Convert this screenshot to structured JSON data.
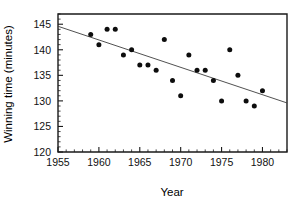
{
  "chart_data": {
    "type": "scatter",
    "title": "",
    "xlabel": "Year",
    "ylabel": "Winning time (minutes)",
    "xlim": [
      1955,
      1983
    ],
    "ylim": [
      120,
      147
    ],
    "grid": false,
    "legend": null,
    "x_ticks_major": [
      1955,
      1960,
      1965,
      1970,
      1975,
      1980
    ],
    "x_tick_labels": [
      "1955",
      "1960",
      "1965",
      "1970",
      "1975",
      "1980"
    ],
    "x_minor_step": 1,
    "y_ticks_major": [
      120,
      125,
      130,
      135,
      140,
      145
    ],
    "y_tick_labels": [
      "120",
      "125",
      "130",
      "135",
      "140",
      "145"
    ],
    "y_minor_step": 1,
    "x": [
      1959,
      1960,
      1961,
      1962,
      1963,
      1964,
      1965,
      1966,
      1967,
      1968,
      1969,
      1970,
      1971,
      1972,
      1973,
      1974,
      1975,
      1976,
      1977,
      1978,
      1979,
      1980
    ],
    "values": [
      143,
      141,
      144,
      144,
      139,
      140,
      137,
      137,
      136,
      142,
      134,
      131,
      139,
      136,
      136,
      134,
      130,
      140,
      135,
      130,
      129,
      132
    ],
    "points": [
      {
        "x": 1959,
        "y": 143
      },
      {
        "x": 1960,
        "y": 141
      },
      {
        "x": 1961,
        "y": 144
      },
      {
        "x": 1962,
        "y": 144
      },
      {
        "x": 1963,
        "y": 139
      },
      {
        "x": 1964,
        "y": 140
      },
      {
        "x": 1965,
        "y": 137
      },
      {
        "x": 1966,
        "y": 137
      },
      {
        "x": 1967,
        "y": 136
      },
      {
        "x": 1968,
        "y": 142
      },
      {
        "x": 1969,
        "y": 134
      },
      {
        "x": 1970,
        "y": 131
      },
      {
        "x": 1971,
        "y": 139
      },
      {
        "x": 1972,
        "y": 136
      },
      {
        "x": 1973,
        "y": 136
      },
      {
        "x": 1974,
        "y": 134
      },
      {
        "x": 1975,
        "y": 130
      },
      {
        "x": 1976,
        "y": 140
      },
      {
        "x": 1977,
        "y": 135
      },
      {
        "x": 1978,
        "y": 130
      },
      {
        "x": 1979,
        "y": 129
      },
      {
        "x": 1980,
        "y": 132
      }
    ],
    "trend_line": {
      "x_start": 1955,
      "y_start": 144.6,
      "x_end": 1983,
      "y_end": 129.6
    },
    "marker_color": "#0d0d0d",
    "trend_color": "#3d3d3d",
    "axis_color": "#1a1a1a",
    "background": "#ffffff"
  }
}
